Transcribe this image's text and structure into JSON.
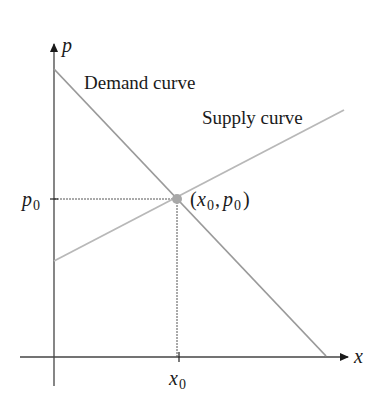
{
  "diagram": {
    "type": "supply-demand",
    "axes": {
      "x_label": "x",
      "y_label": "p"
    },
    "curves": [
      {
        "name": "Demand curve",
        "label": "Demand curve",
        "from": [
          54,
          69
        ],
        "to": [
          326,
          356
        ],
        "color": "#9a9a9a"
      },
      {
        "name": "Supply curve",
        "label": "Supply curve",
        "from": [
          54,
          261
        ],
        "to": [
          344,
          110
        ],
        "color": "#b5b5b5"
      }
    ],
    "equilibrium": {
      "label": "(x0, p0)",
      "x_tick_label": "x0",
      "y_tick_label": "p0",
      "point_color": "#a8a8a8"
    },
    "colors": {
      "axis": "#333333",
      "guide": "#555555"
    }
  }
}
